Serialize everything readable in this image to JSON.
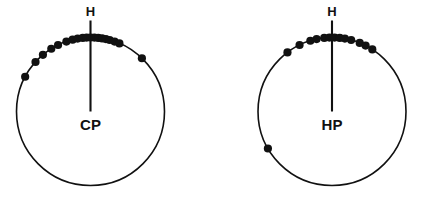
{
  "figure": {
    "width": 430,
    "height": 210,
    "background": "#ffffff",
    "ink_color": "#111111"
  },
  "chart_data": {
    "type": "scatter",
    "subtype": "circular-orientation-diagram",
    "title": "",
    "xlabel": "",
    "ylabel": "",
    "grid": false,
    "legend": null,
    "axis_units": "degrees",
    "axis_range": [
      0,
      360
    ],
    "north_label": "H",
    "note": "Two circular plots; each dot is one observation plotted on the circle perimeter at its azimuth. 0 degrees = up (H).",
    "plots": [
      {
        "id": "left",
        "center_label": "CP",
        "north_label": "H",
        "center": {
          "x": 90.5,
          "y": 111.5
        },
        "radius": 74,
        "n_points": 19,
        "mean_vector_direction_deg": 0,
        "mean_vector_length": 0.93,
        "point_angles_deg": [
          -62,
          -48,
          -40,
          -32,
          -26,
          -19,
          -14,
          -10,
          -6,
          -3,
          0,
          3,
          6,
          9,
          12,
          15,
          19,
          23,
          44
        ]
      },
      {
        "id": "right",
        "center_label": "HP",
        "north_label": "H",
        "center": {
          "x": 332,
          "y": 111.5
        },
        "radius": 74,
        "n_points": 14,
        "mean_vector_direction_deg": 2,
        "mean_vector_length": 0.88,
        "point_angles_deg": [
          -120,
          -37,
          -26,
          -17,
          -12,
          -6,
          -2,
          2,
          6,
          10,
          15,
          22,
          27,
          33
        ]
      }
    ]
  },
  "labels": {
    "left_center": "CP",
    "left_north": "H",
    "right_center": "HP",
    "right_north": "H"
  },
  "geometry": {
    "dot_radius": 4.1,
    "north_tick_length": 17,
    "radius_line_from_center_frac": 0.0,
    "radius_line_to_frac": 1.0
  }
}
